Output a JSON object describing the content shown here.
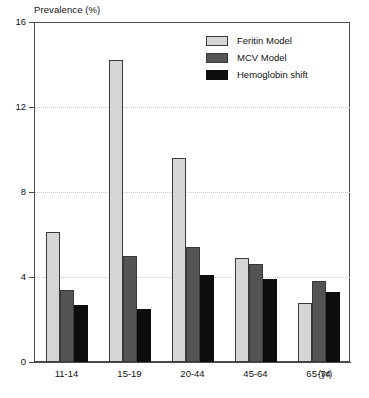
{
  "chart_data": {
    "type": "bar",
    "title": "",
    "xlabel": "(yr)",
    "ylabel": "Prevalence (%)",
    "categories": [
      "11-14",
      "15-19",
      "20-44",
      "45-64",
      "65-74"
    ],
    "series": [
      {
        "name": "Feritin Model",
        "color": "#d6d6d6",
        "values": [
          6.1,
          14.2,
          9.6,
          4.9,
          2.8
        ]
      },
      {
        "name": "MCV Model",
        "color": "#545454",
        "values": [
          3.4,
          5.0,
          5.4,
          4.6,
          3.8
        ]
      },
      {
        "name": "Hemoglobin shift",
        "color": "#0d0d0d",
        "values": [
          2.7,
          2.5,
          4.1,
          3.9,
          3.3
        ]
      }
    ],
    "ylim": [
      0,
      16
    ],
    "yticks": [
      0,
      4,
      8,
      12,
      16
    ],
    "ytick_labels": [
      "0",
      "4",
      "8",
      "12",
      "16"
    ],
    "grid": true,
    "grid_style": "dotted",
    "grid_axis": "y",
    "legend_position": "top-right"
  },
  "axis": {
    "y_title": "Prevalence (%)",
    "x_unit": "(yr)"
  }
}
